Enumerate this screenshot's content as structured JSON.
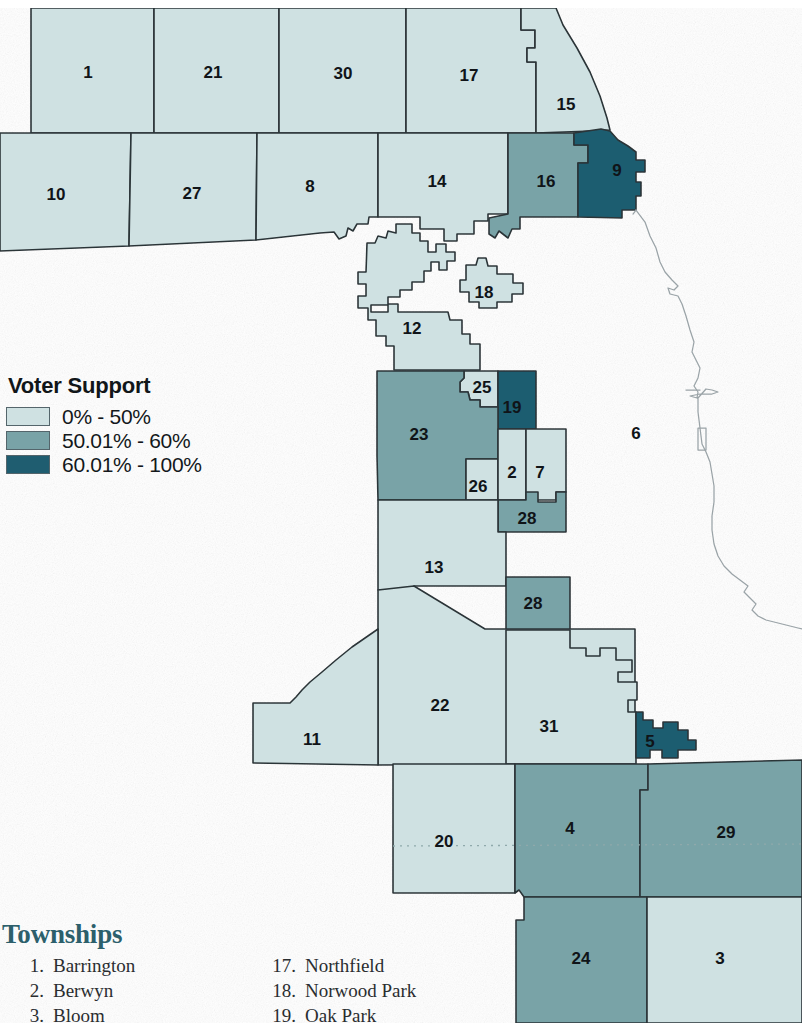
{
  "map": {
    "title": "Cook County Townships Voter Support",
    "colors": {
      "low": "#cfe1e2",
      "mid": "#79a3a7",
      "high": "#1f5d70",
      "unshaded": "#ffffff",
      "border": "#2b3438",
      "shoreline": "#9aa3a7",
      "heading_teal": "#2c5f6b"
    },
    "regions": [
      {
        "id": "1",
        "label": "1",
        "class": "low",
        "lx": 88,
        "ly": 72
      },
      {
        "id": "21",
        "label": "21",
        "class": "low",
        "lx": 213,
        "ly": 72
      },
      {
        "id": "30",
        "label": "30",
        "class": "low",
        "lx": 343,
        "ly": 73
      },
      {
        "id": "17",
        "label": "17",
        "class": "low",
        "lx": 469,
        "ly": 75
      },
      {
        "id": "15",
        "label": "15",
        "class": "low",
        "lx": 566,
        "ly": 104
      },
      {
        "id": "9",
        "label": "9",
        "class": "high",
        "lx": 617,
        "ly": 170
      },
      {
        "id": "10",
        "label": "10",
        "class": "low",
        "lx": 56,
        "ly": 194
      },
      {
        "id": "27",
        "label": "27",
        "class": "low",
        "lx": 192,
        "ly": 193
      },
      {
        "id": "8",
        "label": "8",
        "class": "low",
        "lx": 310,
        "ly": 186
      },
      {
        "id": "14",
        "label": "14",
        "class": "low",
        "lx": 437,
        "ly": 181
      },
      {
        "id": "16",
        "label": "16",
        "class": "mid",
        "lx": 546,
        "ly": 181
      },
      {
        "id": "18",
        "label": "18",
        "class": "low",
        "lx": 484,
        "ly": 292
      },
      {
        "id": "12",
        "label": "12",
        "class": "low",
        "lx": 412,
        "ly": 328
      },
      {
        "id": "25",
        "label": "25",
        "class": "low",
        "lx": 482,
        "ly": 387
      },
      {
        "id": "19",
        "label": "19",
        "class": "high",
        "lx": 512,
        "ly": 407
      },
      {
        "id": "23",
        "label": "23",
        "class": "mid",
        "lx": 419,
        "ly": 434
      },
      {
        "id": "6",
        "label": "6",
        "class": "unshaded",
        "lx": 636,
        "ly": 433
      },
      {
        "id": "26",
        "label": "26",
        "class": "low",
        "lx": 478,
        "ly": 486
      },
      {
        "id": "2",
        "label": "2",
        "class": "low",
        "lx": 512,
        "ly": 472
      },
      {
        "id": "7",
        "label": "7",
        "class": "low",
        "lx": 540,
        "ly": 472
      },
      {
        "id": "28a",
        "label": "28",
        "class": "mid",
        "lx": 527,
        "ly": 518
      },
      {
        "id": "13",
        "label": "13",
        "class": "low",
        "lx": 434,
        "ly": 567
      },
      {
        "id": "28b",
        "label": "28",
        "class": "mid",
        "lx": 533,
        "ly": 603
      },
      {
        "id": "22",
        "label": "22",
        "class": "low",
        "lx": 440,
        "ly": 705
      },
      {
        "id": "11",
        "label": "11",
        "class": "low",
        "lx": 312,
        "ly": 739
      },
      {
        "id": "31",
        "label": "31",
        "class": "low",
        "lx": 549,
        "ly": 726
      },
      {
        "id": "5",
        "label": "5",
        "class": "high",
        "lx": 650,
        "ly": 741
      },
      {
        "id": "20",
        "label": "20",
        "class": "low",
        "lx": 444,
        "ly": 841
      },
      {
        "id": "4",
        "label": "4",
        "class": "mid",
        "lx": 570,
        "ly": 828
      },
      {
        "id": "29",
        "label": "29",
        "class": "mid",
        "lx": 726,
        "ly": 832
      },
      {
        "id": "24",
        "label": "24",
        "class": "mid",
        "lx": 581,
        "ly": 958
      },
      {
        "id": "3",
        "label": "3",
        "class": "low",
        "lx": 720,
        "ly": 958
      }
    ]
  },
  "legend": {
    "title": "Voter Support",
    "items": [
      {
        "label": "0% - 50%",
        "color": "#cfe1e2",
        "key": "low"
      },
      {
        "label": "50.01% - 60%",
        "color": "#79a3a7",
        "key": "mid"
      },
      {
        "label": "60.01% - 100%",
        "color": "#1f5d70",
        "key": "high"
      }
    ]
  },
  "townships": {
    "heading": "Townships",
    "column_left": [
      {
        "num": "1.",
        "name": "Barrington"
      },
      {
        "num": "2.",
        "name": "Berwyn"
      },
      {
        "num": "3.",
        "name": "Bloom"
      }
    ],
    "column_right": [
      {
        "num": "17.",
        "name": "Northfield"
      },
      {
        "num": "18.",
        "name": "Norwood Park"
      },
      {
        "num": "19.",
        "name": "Oak Park"
      }
    ]
  }
}
